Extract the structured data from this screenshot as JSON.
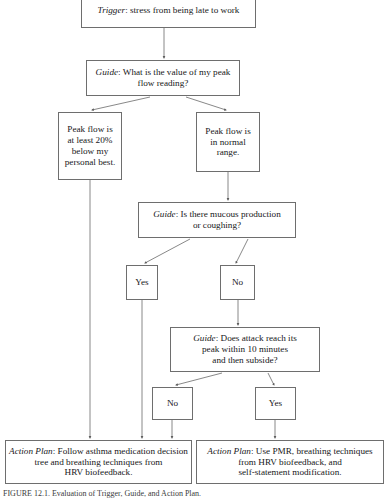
{
  "figure": {
    "type": "flowchart",
    "caption": "FIGURE 12.1. Evaluation of Trigger, Guide, and Action Plan."
  },
  "nodes": {
    "trigger": {
      "label_prefix": "Trigger",
      "text": "Trigger: stress from being late to work"
    },
    "guide1": {
      "label_prefix": "Guide",
      "text": "Guide: What is the value of my peak\nflow reading?"
    },
    "peak_low": {
      "text": "Peak flow is\nat least 20%\nbelow my\npersonal best."
    },
    "peak_normal": {
      "text": "Peak flow is\nin normal\nrange."
    },
    "guide2": {
      "label_prefix": "Guide",
      "text": "Guide: Is there mucous production\nor coughing?"
    },
    "yes1": {
      "text": "Yes"
    },
    "no1": {
      "text": "No"
    },
    "guide3": {
      "label_prefix": "Guide",
      "text": "Guide: Does attack reach its\npeak within 10 minutes\nand then subside?"
    },
    "no2": {
      "text": "No"
    },
    "yes2": {
      "text": "Yes"
    },
    "action1": {
      "label_prefix": "Action Plan",
      "text": "Action Plan: Follow asthma medication decision\ntree and breathing techniques from\nHRV biofeedback."
    },
    "action2": {
      "label_prefix": "Action Plan",
      "text": "Action Plan: Use PMR, breathing techniques\nfrom HRV biofeedback, and\nself-statement modification."
    }
  },
  "chart_data": {
    "type": "diagram",
    "node_sequence": [
      "Trigger: stress from being late to work",
      "Guide: What is the value of my peak flow reading?",
      "Peak flow is at least 20% below my personal best.",
      "Peak flow is in normal range.",
      "Guide: Is there mucous production or coughing?",
      "Yes",
      "No",
      "Guide: Does attack reach its peak within 10 minutes and then subside?",
      "No",
      "Yes",
      "Action Plan: Follow asthma medication decision tree and breathing techniques from HRV biofeedback.",
      "Action Plan: Use PMR, breathing techniques from HRV biofeedback, and self-statement modification."
    ],
    "edges": [
      {
        "from": "trigger",
        "to": "guide1",
        "label": ""
      },
      {
        "from": "guide1",
        "to": "peak_low",
        "label": ""
      },
      {
        "from": "guide1",
        "to": "peak_normal",
        "label": ""
      },
      {
        "from": "peak_low",
        "to": "action1",
        "label": ""
      },
      {
        "from": "peak_normal",
        "to": "guide2",
        "label": ""
      },
      {
        "from": "guide2",
        "to": "yes1",
        "label": ""
      },
      {
        "from": "guide2",
        "to": "no1",
        "label": ""
      },
      {
        "from": "yes1",
        "to": "action1",
        "label": ""
      },
      {
        "from": "no1",
        "to": "guide3",
        "label": ""
      },
      {
        "from": "guide3",
        "to": "no2",
        "label": ""
      },
      {
        "from": "guide3",
        "to": "yes2",
        "label": ""
      },
      {
        "from": "no2",
        "to": "action1",
        "label": ""
      },
      {
        "from": "yes2",
        "to": "action2",
        "label": ""
      }
    ],
    "edge_count": 13,
    "node_count": 12,
    "line_color": "#6e6e6e",
    "background_color": "#ffffff"
  }
}
